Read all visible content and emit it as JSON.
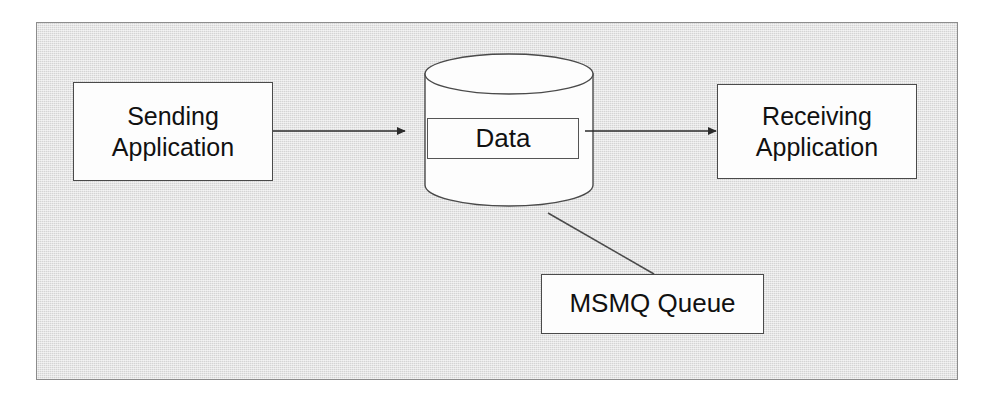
{
  "diagram": {
    "background_color": "#d4d4d4",
    "frame_border_color": "#8c8c8c",
    "node_fill_color": "#fdfdfd",
    "node_border_color": "#4a4a4a",
    "line_color": "#333333",
    "nodes": {
      "sending_application": {
        "label": "Sending\nApplication",
        "line1": "Sending",
        "line2": "Application",
        "shape": "rectangle"
      },
      "queue_store": {
        "shape": "cylinder",
        "inner_label": "Data"
      },
      "receiving_application": {
        "label": "Receiving\nApplication",
        "line1": "Receiving",
        "line2": "Application",
        "shape": "rectangle"
      },
      "queue_callout": {
        "label": "MSMQ Queue",
        "shape": "rectangle"
      }
    },
    "edges": [
      {
        "id": "send-to-queue",
        "from": "sending_application",
        "to": "queue_store",
        "style": "solid",
        "arrowhead": "filled-triangle"
      },
      {
        "id": "queue-to-receive",
        "from": "queue_store",
        "to": "receiving_application",
        "style": "solid",
        "arrowhead": "filled-triangle"
      },
      {
        "id": "queue-callout-leader",
        "from": "queue_store",
        "to": "queue_callout",
        "style": "solid",
        "arrowhead": "none"
      }
    ]
  }
}
